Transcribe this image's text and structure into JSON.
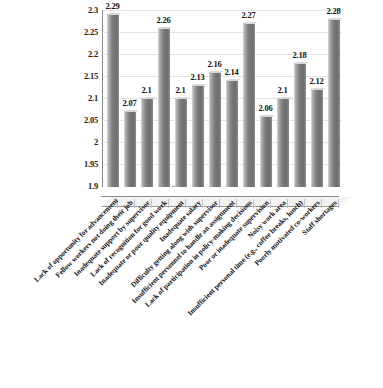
{
  "chart_data": {
    "type": "bar",
    "title": "",
    "subtitle": "",
    "xlabel": "",
    "ylabel": "",
    "ylim": [
      1.9,
      2.3
    ],
    "ytick_labels": [
      "2.3",
      "2.25",
      "2.2",
      "2.15",
      "2.1",
      "2.05",
      "2",
      "1.95",
      "1.9"
    ],
    "ytick_values": [
      2.3,
      2.25,
      2.2,
      2.15,
      2.1,
      2.05,
      2.0,
      1.95,
      1.9
    ],
    "grid": true,
    "legend": "none",
    "categories": [
      "Lack of opportunity for advancement",
      "Fellow workers not doing their job",
      "Inadequate support by supervisor",
      "Lack of recognition for good work",
      "Inadequate or poor quality equipment",
      "Inadequate salary",
      "Difficulty getting along with supervisor",
      "Insufficient personnel to handle an assignment",
      "Lack of participation in policy-making decisions",
      "Poor or inadequate supervision",
      "Noisy work area",
      "Insufficient personal time (e.g., coffee breaks, lunch)",
      "Poorly motivated co-workers",
      "Staff shortages"
    ],
    "values": [
      2.29,
      2.07,
      2.1,
      2.26,
      2.1,
      2.13,
      2.16,
      2.14,
      2.27,
      2.06,
      2.1,
      2.18,
      2.12,
      2.28
    ],
    "value_labels": [
      "2.29",
      "2.07",
      "2.1",
      "2.26",
      "2.1",
      "2.13",
      "2.16",
      "2.14",
      "2.27",
      "2.06",
      "2.1",
      "2.18",
      "2.12",
      "2.28"
    ],
    "bar_color": "#7b7b7b",
    "grid_color": "#e2e2e2",
    "axis_color": "#8a8a8a",
    "text_color": "#141414"
  }
}
